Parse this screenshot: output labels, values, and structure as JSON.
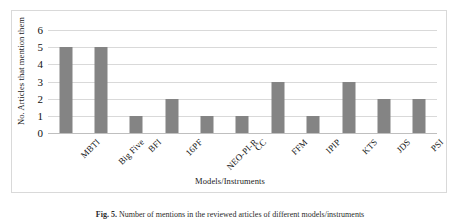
{
  "chart_data": {
    "type": "bar",
    "title": "",
    "xlabel": "Models/Instruments",
    "ylabel": "No. Articles that mention them",
    "categories": [
      "MBTI",
      "Big Five",
      "BFI",
      "16PF",
      "NEO-PI-R",
      "CC",
      "FFM",
      "IPIP",
      "KTS",
      "JDS",
      "PSI"
    ],
    "values": [
      5,
      5,
      1,
      2,
      1,
      1,
      3,
      1,
      3,
      2,
      2
    ],
    "ylim": [
      0,
      6
    ],
    "ytick_labels": [
      "0",
      "1",
      "2",
      "3",
      "4",
      "5",
      "6"
    ],
    "ytick_values": [
      0,
      1,
      2,
      3,
      4,
      5,
      6
    ],
    "grid": true,
    "legend": false,
    "bar_color": "#848484",
    "gridline_color": "#d9d9d9",
    "frame_color": "#d9d9d9"
  },
  "caption": {
    "label": "Fig. 5.",
    "text": "Number of mentions in the reviewed articles of different models/instruments"
  }
}
